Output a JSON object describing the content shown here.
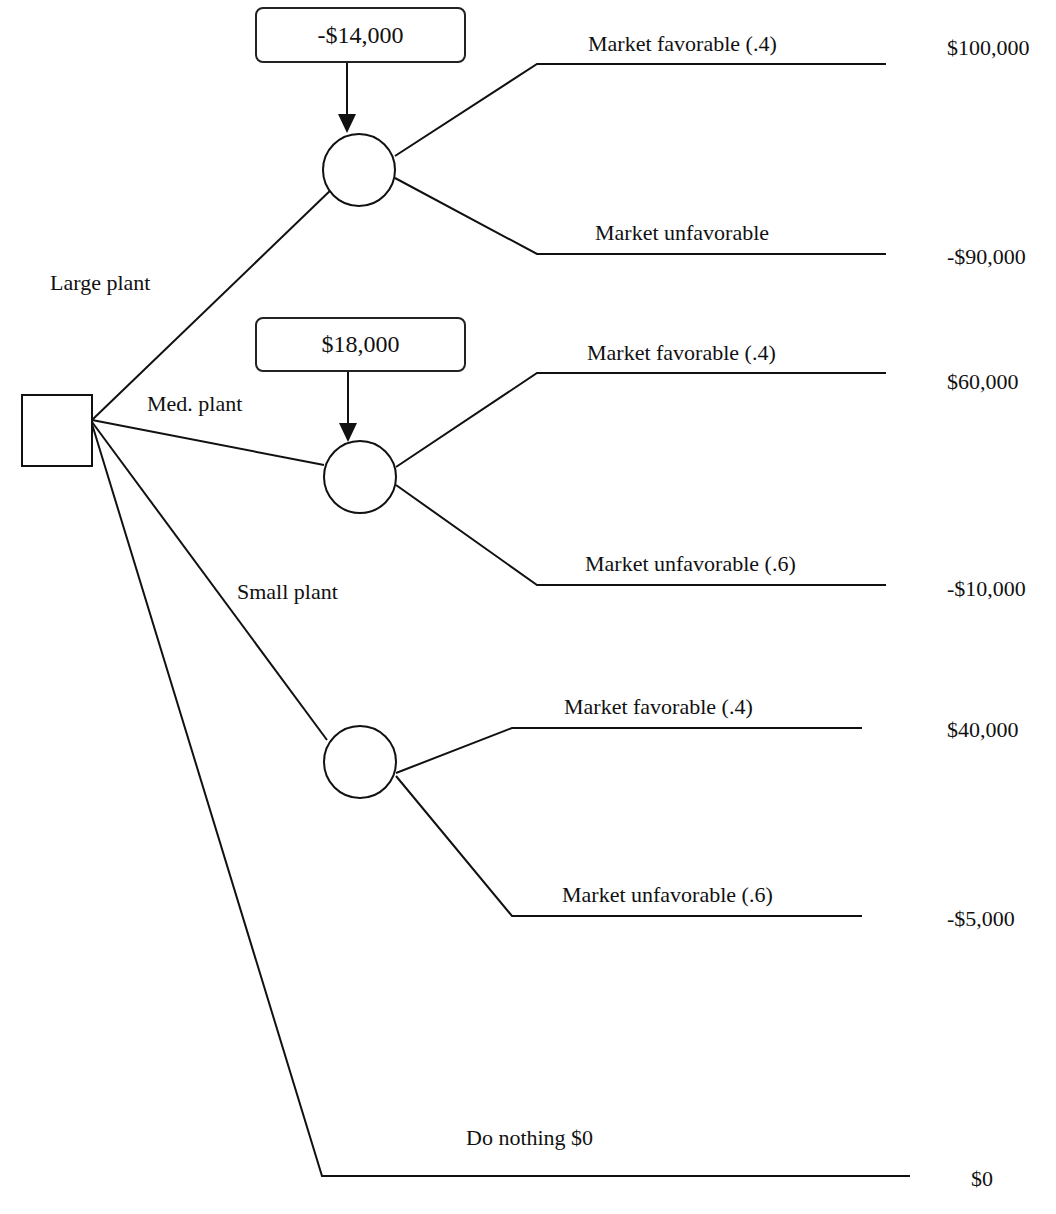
{
  "diagram": {
    "type": "decision-tree",
    "decision_node": {
      "label": ""
    },
    "alternatives": [
      {
        "name": "Large plant",
        "cost": "-$14,000",
        "outcomes": [
          {
            "label": "Market favorable (.4)",
            "payoff": "$100,000"
          },
          {
            "label": "Market unfavorable",
            "payoff": "-$90,000"
          }
        ]
      },
      {
        "name": "Med. plant",
        "cost": "$18,000",
        "outcomes": [
          {
            "label": "Market favorable (.4)",
            "payoff": "$60,000"
          },
          {
            "label": "Market unfavorable (.6)",
            "payoff": "-$10,000"
          }
        ]
      },
      {
        "name": "Small plant",
        "outcomes": [
          {
            "label": "Market favorable (.4)",
            "payoff": "$40,000"
          },
          {
            "label": "Market unfavorable (.6)",
            "payoff": "-$5,000"
          }
        ]
      },
      {
        "name": "Do nothing $0",
        "payoff": "$0"
      }
    ]
  },
  "colors": {
    "line": "#111111",
    "background": "#ffffff"
  }
}
